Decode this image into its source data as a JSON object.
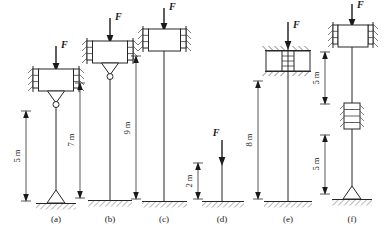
{
  "figure": {
    "background_color": "#ffffff",
    "line_color": "#262626",
    "text_color": "#1a1a1a",
    "units": "m",
    "force_symbol": "F"
  },
  "cases": [
    {
      "id": "a",
      "label": "(a)",
      "force_label": "F",
      "dimension_label": "5 m",
      "length_m": 5,
      "top_condition": "guided-pinned",
      "base_condition": "pinned",
      "segments": 1
    },
    {
      "id": "b",
      "label": "(b)",
      "force_label": "F",
      "dimension_label": "7 m",
      "length_m": 7,
      "top_condition": "guided-pinned",
      "base_condition": "fixed",
      "segments": 1
    },
    {
      "id": "c",
      "label": "(c)",
      "force_label": "F",
      "dimension_label": "9 m",
      "length_m": 9,
      "top_condition": "guided",
      "base_condition": "fixed",
      "segments": 1
    },
    {
      "id": "d",
      "label": "(d)",
      "force_label": "F",
      "dimension_label": "2 m",
      "length_m": 2,
      "top_condition": "free",
      "base_condition": "fixed",
      "segments": 1
    },
    {
      "id": "e",
      "label": "(e)",
      "force_label": "F",
      "dimension_label": "8 m",
      "length_m": 8,
      "top_condition": "fixed",
      "base_condition": "fixed",
      "segments": 1
    },
    {
      "id": "f",
      "label": "(f)",
      "force_label": "F",
      "dimension_label_upper": "5 m",
      "dimension_label_lower": "5 m",
      "length_upper_m": 5,
      "length_lower_m": 5,
      "top_condition": "guided",
      "mid_condition": "lateral-brace",
      "base_condition": "pinned",
      "segments": 2
    }
  ]
}
